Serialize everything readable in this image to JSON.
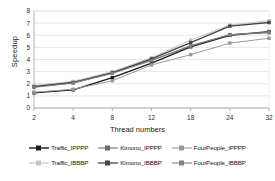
{
  "chart_data": {
    "type": "line",
    "title": "",
    "xlabel": "Thread numbers",
    "ylabel": "Speedup",
    "x": [
      2,
      4,
      8,
      12,
      18,
      24,
      32
    ],
    "xtick_labels": [
      "2",
      "4",
      "8",
      "12",
      "18",
      "24",
      "32"
    ],
    "ytick_labels": [
      "0",
      "1",
      "2",
      "3",
      "4",
      "5",
      "6",
      "7",
      "8"
    ],
    "ylim": [
      0,
      8
    ],
    "grid": true,
    "legend_position": "bottom",
    "series": [
      {
        "name": "Traffic_IPPPP",
        "color": "#1a1a1a",
        "marker": "square",
        "values": [
          1.25,
          1.5,
          2.5,
          3.7,
          5.05,
          6.0,
          6.3
        ]
      },
      {
        "name": "Kimono_IPPPP",
        "color": "#6b6b6b",
        "marker": "square",
        "values": [
          1.8,
          2.15,
          2.95,
          3.95,
          5.1,
          6.05,
          6.2
        ]
      },
      {
        "name": "FourPeople_IPPPP",
        "color": "#9a9a9a",
        "marker": "square",
        "values": [
          1.3,
          1.55,
          2.25,
          3.55,
          4.4,
          5.35,
          5.75
        ]
      },
      {
        "name": "Traffic_IBBBP",
        "color": "#c4c4c4",
        "marker": "square",
        "values": [
          1.85,
          2.2,
          3.0,
          4.15,
          5.6,
          6.85,
          7.2
        ]
      },
      {
        "name": "Kimono_IBBBP",
        "color": "#444444",
        "marker": "square",
        "values": [
          1.75,
          2.1,
          2.9,
          4.05,
          5.4,
          6.75,
          7.05
        ]
      },
      {
        "name": "FourPeople_IBBBP",
        "color": "#808080",
        "marker": "square",
        "values": [
          1.7,
          2.05,
          2.85,
          3.9,
          5.15,
          6.05,
          6.25
        ]
      }
    ]
  },
  "axes": {
    "x_title": "Thread numbers",
    "y_title": "Speedup"
  }
}
